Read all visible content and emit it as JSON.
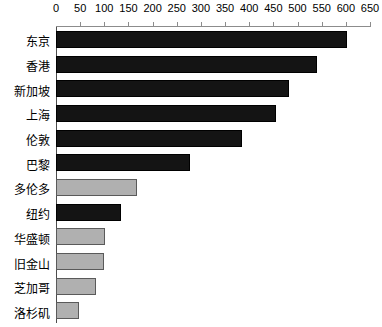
{
  "chart_data": {
    "type": "bar",
    "orientation": "horizontal",
    "title": "",
    "subtitle": "",
    "xlabel": "",
    "ylabel": "",
    "xlim": [
      0,
      650
    ],
    "xticks": [
      0,
      50,
      100,
      150,
      200,
      250,
      300,
      350,
      400,
      450,
      500,
      550,
      600,
      650
    ],
    "grid": false,
    "legend": "none",
    "axis_position": "top",
    "categories": [
      "东京",
      "香港",
      "新加坡",
      "上海",
      "伦敦",
      "巴黎",
      "多伦多",
      "纽约",
      "华盛顿",
      "旧金山",
      "芝加哥",
      "洛杉矶"
    ],
    "values": [
      602,
      540,
      483,
      455,
      385,
      277,
      168,
      135,
      102,
      100,
      82,
      48
    ],
    "bar_colors": [
      "#141414",
      "#141414",
      "#141414",
      "#141414",
      "#141414",
      "#141414",
      "#b0b0b0",
      "#141414",
      "#b0b0b0",
      "#b0b0b0",
      "#b0b0b0",
      "#b0b0b0"
    ],
    "series": [
      {
        "name": "",
        "values": [
          602,
          540,
          483,
          455,
          385,
          277,
          168,
          135,
          102,
          100,
          82,
          48
        ]
      }
    ]
  },
  "colors": {
    "dark_bar": "#141414",
    "light_bar": "#b0b0b0",
    "axis": "#8c8c8c",
    "frame": "#4d4d4d",
    "background": "#ffffff",
    "text": "#000000"
  }
}
